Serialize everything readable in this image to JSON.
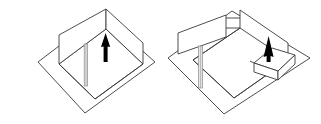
{
  "canvas": {
    "width": 321,
    "height": 124,
    "background": "#ffffff",
    "title": "Isometric room sketch pair"
  },
  "style": {
    "line_color": "#3a3a3a",
    "line_color_light": "#8a8a8a",
    "arrow_fill": "#000000",
    "pole_fill": "#d9d9d9",
    "pole_edge": "#7a7a7a",
    "box_fill": "#ffffff",
    "face_fill": "#ffffff",
    "stroke_width": 0.9
  },
  "figures": [
    {
      "id": "left-figure",
      "name": "room-before",
      "label": "",
      "parts": [
        {
          "name": "ground-plane",
          "type": "quad"
        },
        {
          "name": "room-floor-outline",
          "type": "quad"
        },
        {
          "name": "back-left-wall",
          "type": "quad"
        },
        {
          "name": "back-right-wall",
          "type": "quad"
        },
        {
          "name": "vertical-pole",
          "type": "column"
        },
        {
          "name": "up-arrow-marker",
          "type": "arrow",
          "direction": "up"
        }
      ]
    },
    {
      "id": "right-figure",
      "name": "room-after",
      "label": "",
      "parts": [
        {
          "name": "ground-plane",
          "type": "quad"
        },
        {
          "name": "room-floor-outline",
          "type": "quad"
        },
        {
          "name": "detached-left-wall",
          "type": "quad"
        },
        {
          "name": "back-right-wall",
          "type": "quad"
        },
        {
          "name": "wall-connector",
          "type": "line"
        },
        {
          "name": "vertical-pole",
          "type": "column"
        },
        {
          "name": "flat-box",
          "type": "box"
        },
        {
          "name": "up-arrow-marker",
          "type": "arrow",
          "direction": "up"
        }
      ]
    }
  ]
}
